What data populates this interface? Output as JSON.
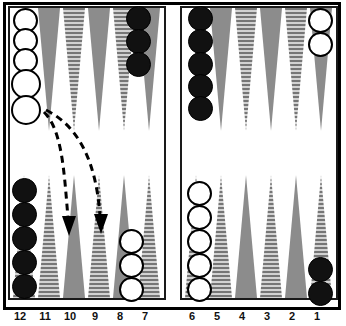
{
  "figure": {
    "kind": "backgammon-board-diagram"
  },
  "colors": {
    "board_background": "#ffffff",
    "frame": "#000000",
    "point_solid": "#8c8c8c",
    "point_hatched_base": "#bdbdbd",
    "point_hatch_line": "#6e6e6e",
    "checker_black": "#111111",
    "checker_white": "#ffffff",
    "checker_outline": "#000000",
    "arrow": "#000000"
  },
  "point_numbers": {
    "left_half": [
      "12",
      "11",
      "10",
      "9",
      "8",
      "7"
    ],
    "right_half": [
      "6",
      "5",
      "4",
      "3",
      "2",
      "1"
    ]
  },
  "checkers": {
    "top_left_quadrant": [
      {
        "point_label": "13",
        "color": "white",
        "count": 5,
        "note": "stack on bar-side point, two lower checkers offset"
      },
      {
        "point_label": "16",
        "color": "black",
        "count": 3
      }
    ],
    "top_right_quadrant": [
      {
        "point_label": "24",
        "color": "black",
        "count": 5
      },
      {
        "point_label": "19",
        "color": "white",
        "count": 2
      }
    ],
    "bottom_left_quadrant": [
      {
        "point_label": "12",
        "color": "black",
        "count": 5
      },
      {
        "point_label": "8",
        "color": "white",
        "count": 3
      }
    ],
    "bottom_right_quadrant": [
      {
        "point_label": "6",
        "color": "white",
        "count": 5
      },
      {
        "point_label": "1",
        "color": "black",
        "count": 2
      }
    ]
  },
  "arrows": [
    {
      "label": "move-arrow-1",
      "from": "bar-area-left",
      "to": "point-10",
      "style": "dashed-curve-down"
    },
    {
      "label": "move-arrow-2",
      "from": "bar-area-left",
      "to": "point-9",
      "style": "dashed-curve-down"
    }
  ]
}
